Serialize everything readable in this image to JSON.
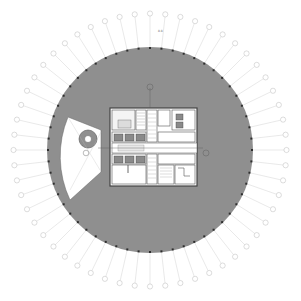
{
  "drawing": {
    "type": "architectural floor plan",
    "subject": "circular tower typical floor",
    "colors": {
      "floor_fill": "#8f8f8f",
      "core_fill": "#ffffff",
      "wall": "#444444",
      "column": "#2e2e2e",
      "grid_line": "#c8c8c8",
      "bubble_stroke": "#a8a8a8",
      "background": "#ffffff"
    },
    "radial_grid_count": 56,
    "annotations": {
      "top_label": "",
      "left_bubble": "",
      "right_bubble": "",
      "top_bubble": ""
    }
  }
}
